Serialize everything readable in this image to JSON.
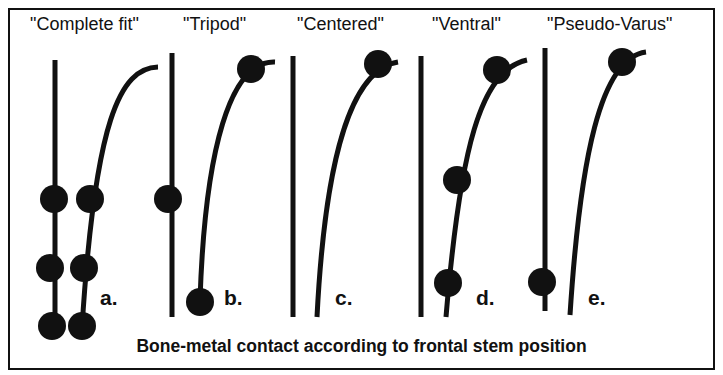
{
  "figure": {
    "caption": "Bone-metal contact according to frontal stem position",
    "colors": {
      "ink": "#111111",
      "background": "#ffffff"
    },
    "panels": [
      {
        "letter": "a.",
        "title": "\"Complete fit\"",
        "contact_points": 6
      },
      {
        "letter": "b.",
        "title": "\"Tripod\"",
        "contact_points": 3
      },
      {
        "letter": "c.",
        "title": "\"Centered\"",
        "contact_points": 1
      },
      {
        "letter": "d.",
        "title": "\"Ventral\"",
        "contact_points": 3
      },
      {
        "letter": "e.",
        "title": "\"Pseudo-Varus\"",
        "contact_points": 2
      }
    ]
  }
}
